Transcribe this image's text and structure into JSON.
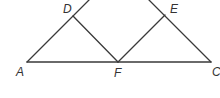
{
  "diagram": {
    "type": "geometry-triangle",
    "points": {
      "A": {
        "label": "A",
        "x": 27,
        "y": 62
      },
      "F": {
        "label": "F",
        "x": 118,
        "y": 62
      },
      "C": {
        "label": "C",
        "x": 211,
        "y": 62
      },
      "D": {
        "label": "D",
        "x": 73,
        "y": 16
      },
      "E": {
        "label": "E",
        "x": 165,
        "y": 15
      }
    },
    "segments": [
      "AC",
      "AD (extends upward)",
      "CE (extends upward)",
      "DF",
      "EF"
    ],
    "labels": {
      "A": "A",
      "D": "D",
      "E": "E",
      "F": "F",
      "C": "C"
    },
    "stroke_color": "#3a3a3a"
  }
}
